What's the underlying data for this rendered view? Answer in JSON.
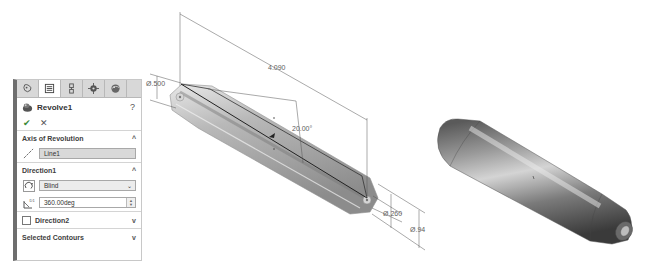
{
  "property_manager": {
    "tabs": [
      {
        "name": "feature-manager-tab",
        "icon": "feature-tree-icon",
        "active": false
      },
      {
        "name": "property-manager-tab",
        "icon": "property-list-icon",
        "active": true
      },
      {
        "name": "configuration-manager-tab",
        "icon": "configuration-icon",
        "active": false
      },
      {
        "name": "dimxpert-manager-tab",
        "icon": "crosshair-icon",
        "active": false
      },
      {
        "name": "display-manager-tab",
        "icon": "appearance-sphere-icon",
        "active": false
      }
    ],
    "feature_title": "Revolve1",
    "help_label": "?",
    "ok_label": "✔",
    "cancel_label": "✕",
    "sections": {
      "axis": {
        "label": "Axis of Revolution",
        "chevron": "^",
        "value": "Line1"
      },
      "direction1": {
        "label": "Direction1",
        "chevron": "^",
        "end_condition": "Blind",
        "angle": "360.00deg"
      },
      "direction2": {
        "label": "Direction2",
        "checked": false,
        "chevron": "v"
      },
      "selected_contours": {
        "label": "Selected Contours",
        "chevron": "v"
      }
    }
  },
  "sketch_view": {
    "dimensions": {
      "overall_length": "4.090",
      "left_diameter": "Ø.500",
      "angle": "20.00°",
      "bore_diameter": "Ø.260",
      "right_diameter": "Ø.94"
    }
  },
  "colors": {
    "panel_border_accent": "#6e6e6e",
    "tab_bar": "#d8d8d8",
    "selection_box": "#d9d9d9",
    "ok_green": "#3a8a3a"
  }
}
